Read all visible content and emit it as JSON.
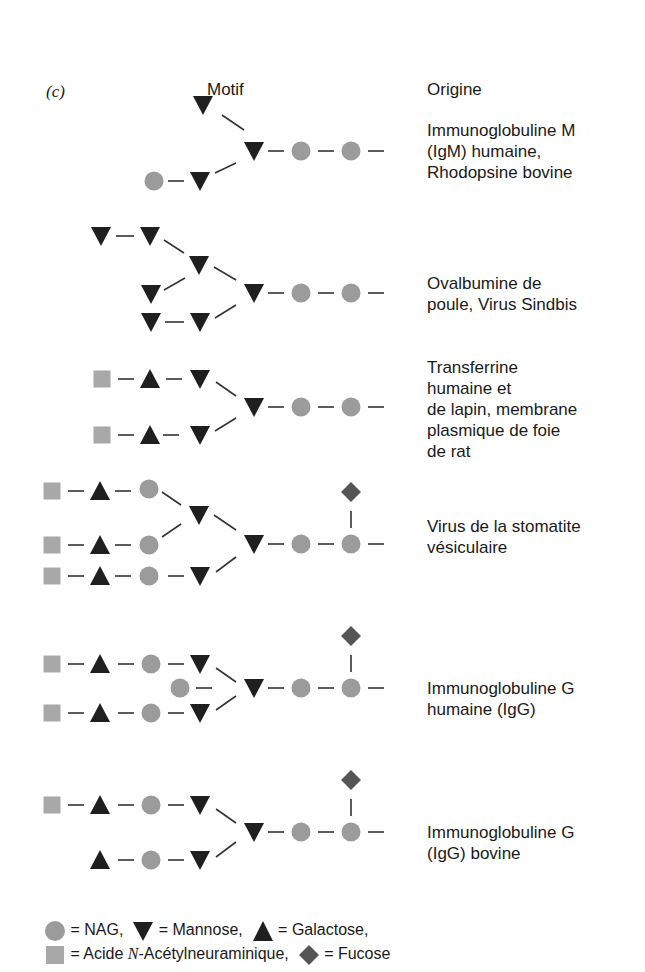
{
  "figure": {
    "panel_label": "(c)",
    "headers": {
      "motif": "Motif",
      "origin": "Origine"
    },
    "colors": {
      "nag_circle": "#9b9b9b",
      "mannose": "#1f1f1f",
      "galactose": "#1f1f1f",
      "sialic_square": "#a8a8a8",
      "fucose_diamond": "#555555",
      "bond_line": "#333333"
    },
    "rows": [
      {
        "origin_lines": [
          "Immunoglobuline M",
          "(IgM) humaine,",
          "Rhodopsine bovine"
        ]
      },
      {
        "origin_lines": [
          "Ovalbumine de",
          "poule, Virus Sindbis"
        ]
      },
      {
        "origin_lines": [
          "Transferrine",
          "humaine et",
          "de lapin, membrane",
          "plasmique de foie",
          "de rat"
        ]
      },
      {
        "origin_lines": [
          "Virus de la stomatite",
          "vésiculaire"
        ]
      },
      {
        "origin_lines": [
          "Immunoglobuline G",
          "humaine (IgG)"
        ]
      },
      {
        "origin_lines": [
          "Immunoglobuline G",
          "(IgG) bovine"
        ]
      }
    ],
    "legend": {
      "nag": "= NAG,",
      "mannose": "= Mannose,",
      "galactose": "= Galactose,",
      "sialic_prefix": "= Acide ",
      "sialic_italic": "N",
      "sialic_suffix": "-Acétylneuraminique,",
      "fucose": "= Fucose"
    }
  }
}
